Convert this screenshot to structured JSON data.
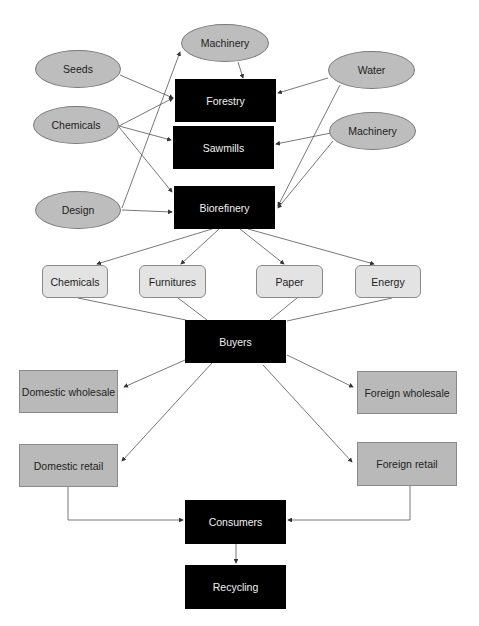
{
  "diagram": {
    "inputs": {
      "machinery_top": "Machinery",
      "seeds": "Seeds",
      "chemicals": "Chemicals",
      "design": "Design",
      "water": "Water",
      "machinery_right": "Machinery"
    },
    "processes": {
      "forestry": "Forestry",
      "sawmills": "Sawmills",
      "biorefinery": "Biorefinery"
    },
    "products": [
      "Chemicals",
      "Furnitures",
      "Paper",
      "Energy"
    ],
    "buyers": "Buyers",
    "channels": {
      "domestic_wholesale": "Domestic wholesale",
      "foreign_wholesale": "Foreign wholesale",
      "domestic_retail": "Domestic retail",
      "foreign_retail": "Foreign retail"
    },
    "consumers": "Consumers",
    "recycling": "Recycling",
    "colors": {
      "input_fill": "#bdbdbd",
      "process_fill": "#000000",
      "product_fill": "#e3e3e3",
      "channel_fill": "#b9b9b9",
      "edge": "#555555"
    },
    "edges": [
      {
        "from": "Seeds",
        "to": "Forestry"
      },
      {
        "from": "Chemicals",
        "to": "Forestry"
      },
      {
        "from": "Chemicals",
        "to": "Sawmills"
      },
      {
        "from": "Chemicals",
        "to": "Biorefinery"
      },
      {
        "from": "Design",
        "to": "Machinery"
      },
      {
        "from": "Design",
        "to": "Biorefinery"
      },
      {
        "from": "Machinery",
        "to": "Forestry"
      },
      {
        "from": "Water",
        "to": "Forestry"
      },
      {
        "from": "Water",
        "to": "Biorefinery"
      },
      {
        "from": "Machinery (right)",
        "to": "Sawmills"
      },
      {
        "from": "Machinery (right)",
        "to": "Biorefinery"
      },
      {
        "from": "Biorefinery",
        "to": "Chemicals"
      },
      {
        "from": "Biorefinery",
        "to": "Furnitures"
      },
      {
        "from": "Biorefinery",
        "to": "Paper"
      },
      {
        "from": "Biorefinery",
        "to": "Energy"
      },
      {
        "from": "Products",
        "to": "Buyers"
      },
      {
        "from": "Buyers",
        "to": "Domestic wholesale"
      },
      {
        "from": "Buyers",
        "to": "Foreign wholesale"
      },
      {
        "from": "Buyers",
        "to": "Domestic retail"
      },
      {
        "from": "Buyers",
        "to": "Foreign retail"
      },
      {
        "from": "Domestic retail",
        "to": "Consumers"
      },
      {
        "from": "Foreign retail",
        "to": "Consumers"
      },
      {
        "from": "Consumers",
        "to": "Recycling"
      }
    ]
  }
}
